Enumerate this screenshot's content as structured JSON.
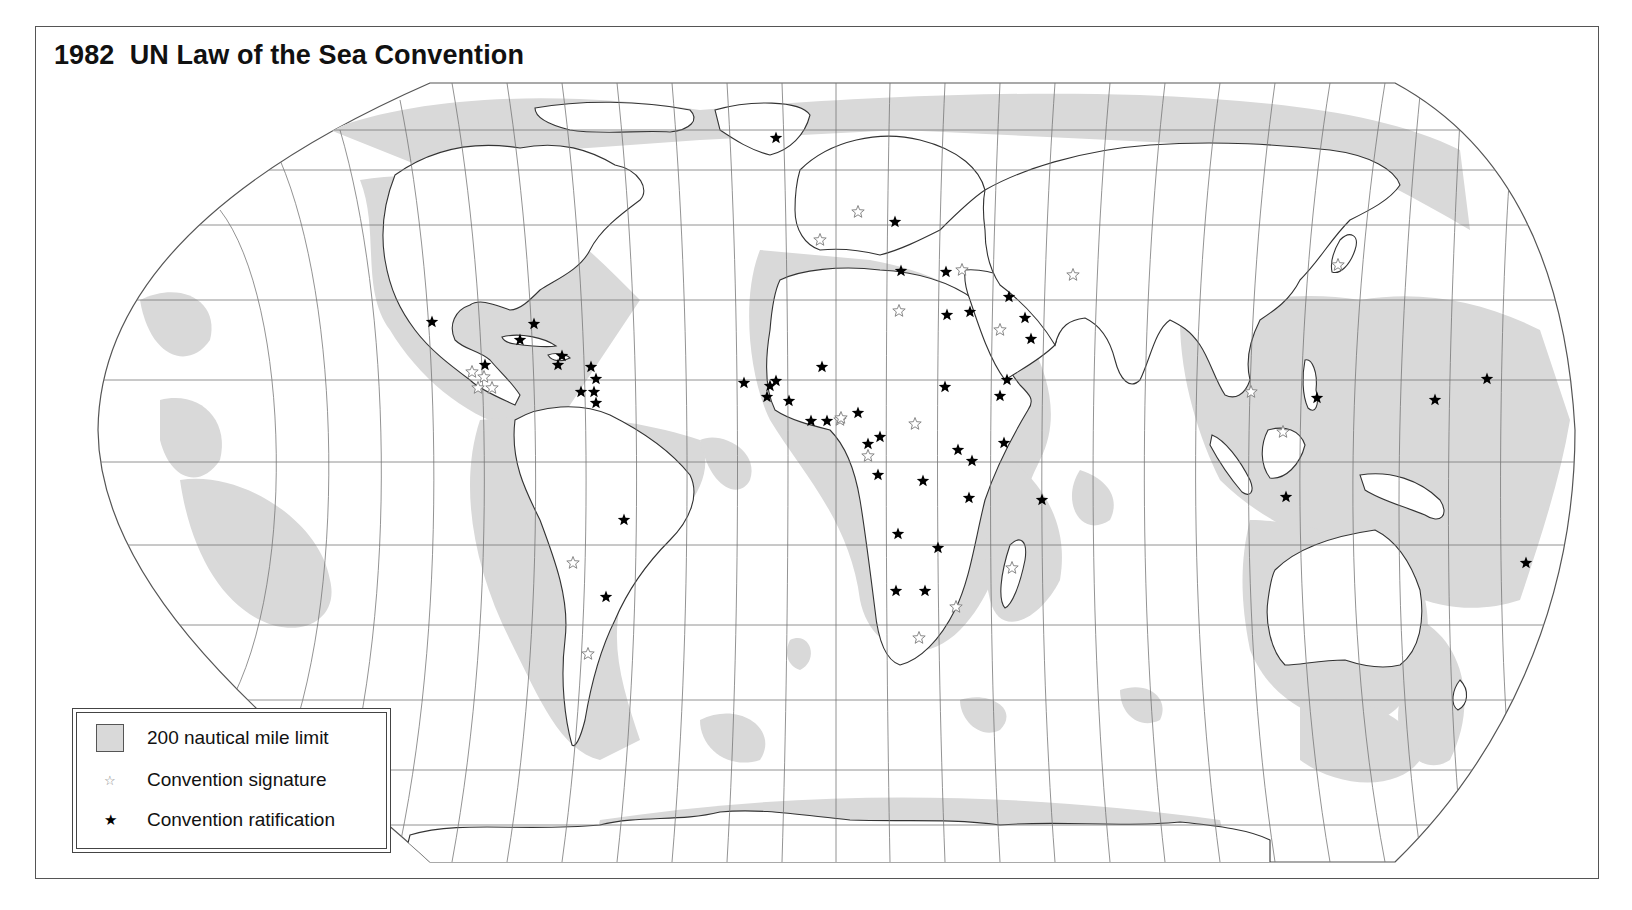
{
  "title": "1982  UN Law of the Sea Convention",
  "colors": {
    "zone_fill": "#d9d9d9",
    "land_fill": "#ffffff",
    "grid": "#777777",
    "coast": "#333333",
    "ratification": "#000000",
    "signature_outline": "#888888"
  },
  "legend": {
    "items": [
      {
        "symbol": "gray-square",
        "label": "200 nautical mile limit"
      },
      {
        "symbol": "open-star",
        "label": "Convention signature"
      },
      {
        "symbol": "solid-star",
        "label": "Convention ratification"
      }
    ]
  },
  "symbols": {
    "open_star": "☆",
    "solid_star": "★"
  },
  "markers": {
    "ratification": [
      [
        776,
        138
      ],
      [
        432,
        322
      ],
      [
        534,
        324
      ],
      [
        520,
        340
      ],
      [
        562,
        356
      ],
      [
        558,
        365
      ],
      [
        485,
        365
      ],
      [
        591,
        367
      ],
      [
        596,
        379
      ],
      [
        581,
        392
      ],
      [
        594,
        392
      ],
      [
        596,
        403
      ],
      [
        744,
        383
      ],
      [
        770,
        386
      ],
      [
        767,
        397
      ],
      [
        776,
        381
      ],
      [
        822,
        367
      ],
      [
        789,
        401
      ],
      [
        811,
        421
      ],
      [
        827,
        421
      ],
      [
        858,
        413
      ],
      [
        880,
        437
      ],
      [
        901,
        271
      ],
      [
        946,
        272
      ],
      [
        970,
        312
      ],
      [
        1009,
        297
      ],
      [
        1025,
        318
      ],
      [
        947,
        315
      ],
      [
        1031,
        339
      ],
      [
        945,
        387
      ],
      [
        1007,
        380
      ],
      [
        1000,
        396
      ],
      [
        1004,
        443
      ],
      [
        868,
        444
      ],
      [
        878,
        475
      ],
      [
        958,
        450
      ],
      [
        972,
        461
      ],
      [
        923,
        481
      ],
      [
        969,
        498
      ],
      [
        1042,
        500
      ],
      [
        898,
        534
      ],
      [
        938,
        548
      ],
      [
        896,
        591
      ],
      [
        925,
        591
      ],
      [
        624,
        520
      ],
      [
        606,
        597
      ],
      [
        1317,
        398
      ],
      [
        1286,
        497
      ],
      [
        1435,
        400
      ],
      [
        1487,
        379
      ],
      [
        1526,
        563
      ],
      [
        895,
        222
      ]
    ],
    "signature": [
      [
        820,
        240
      ],
      [
        858,
        212
      ],
      [
        962,
        270
      ],
      [
        899,
        311
      ],
      [
        1000,
        330
      ],
      [
        1073,
        275
      ],
      [
        1338,
        265
      ],
      [
        472,
        372
      ],
      [
        478,
        388
      ],
      [
        492,
        388
      ],
      [
        484,
        377
      ],
      [
        915,
        424
      ],
      [
        868,
        456
      ],
      [
        840,
        420
      ],
      [
        956,
        607
      ],
      [
        919,
        638
      ],
      [
        1012,
        568
      ],
      [
        1251,
        392
      ],
      [
        1283,
        432
      ],
      [
        573,
        563
      ],
      [
        588,
        654
      ],
      [
        841,
        418
      ]
    ]
  }
}
